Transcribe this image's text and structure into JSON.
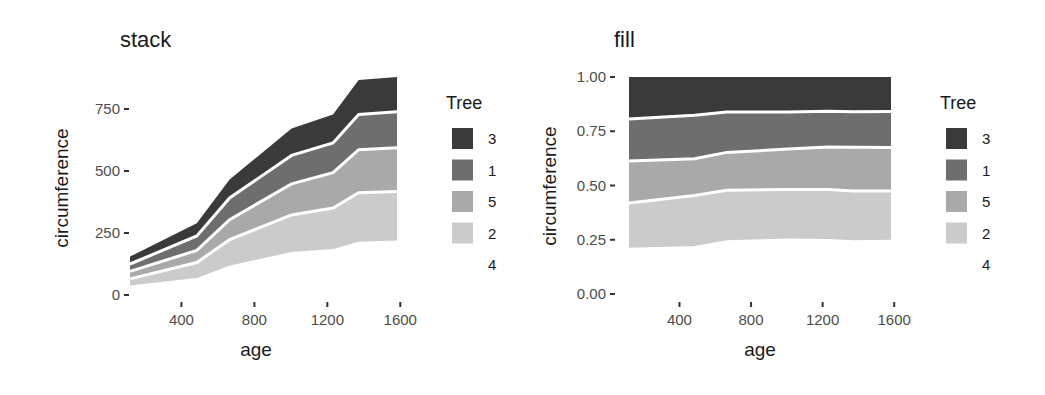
{
  "chart_data": [
    {
      "type": "area",
      "position": "stack",
      "title": "stack",
      "xlabel": "age",
      "ylabel": "circumference",
      "x": [
        118,
        484,
        664,
        1004,
        1231,
        1372,
        1582
      ],
      "stack_order_top_to_bottom": [
        "3",
        "1",
        "5",
        "2",
        "4"
      ],
      "series": [
        {
          "name": "3",
          "values": [
            30,
            51,
            75,
            108,
            115,
            139,
            140
          ]
        },
        {
          "name": "1",
          "values": [
            30,
            58,
            87,
            115,
            120,
            142,
            145
          ]
        },
        {
          "name": "5",
          "values": [
            30,
            49,
            81,
            125,
            142,
            174,
            177
          ]
        },
        {
          "name": "2",
          "values": [
            33,
            69,
            111,
            156,
            172,
            203,
            203
          ]
        },
        {
          "name": "4",
          "values": [
            32,
            62,
            112,
            167,
            179,
            209,
            214
          ]
        }
      ],
      "xticks": [
        400,
        800,
        1200,
        1600
      ],
      "yticks": [
        0,
        250,
        500,
        750
      ],
      "ytick_labels": [
        "0",
        "250",
        "500",
        "750"
      ],
      "xlim": [
        118,
        1582
      ],
      "ylim": [
        0,
        879
      ],
      "grid": false,
      "legend": {
        "title": "Tree",
        "position": "right",
        "entries": [
          "3",
          "1",
          "5",
          "2",
          "4"
        ]
      }
    },
    {
      "type": "area",
      "position": "fill",
      "title": "fill",
      "xlabel": "age",
      "ylabel": "circumference",
      "x": [
        118,
        484,
        664,
        1004,
        1231,
        1372,
        1582
      ],
      "stack_order_top_to_bottom": [
        "3",
        "1",
        "5",
        "2",
        "4"
      ],
      "series": [
        {
          "name": "3",
          "values": [
            30,
            51,
            75,
            108,
            115,
            139,
            140
          ]
        },
        {
          "name": "1",
          "values": [
            30,
            58,
            87,
            115,
            120,
            142,
            145
          ]
        },
        {
          "name": "5",
          "values": [
            30,
            49,
            81,
            125,
            142,
            174,
            177
          ]
        },
        {
          "name": "2",
          "values": [
            33,
            69,
            111,
            156,
            172,
            203,
            203
          ]
        },
        {
          "name": "4",
          "values": [
            32,
            62,
            112,
            167,
            179,
            209,
            214
          ]
        }
      ],
      "xticks": [
        400,
        800,
        1200,
        1600
      ],
      "yticks": [
        0,
        0.25,
        0.5,
        0.75,
        1.0
      ],
      "ytick_labels": [
        "0.00",
        "0.25",
        "0.50",
        "0.75",
        "1.00"
      ],
      "xlim": [
        118,
        1582
      ],
      "ylim": [
        0,
        1
      ],
      "grid": false,
      "legend": {
        "title": "Tree",
        "position": "right",
        "entries": [
          "3",
          "1",
          "5",
          "2",
          "4"
        ]
      }
    }
  ],
  "colors": {
    "3": "#3a3a3a",
    "1": "#6e6e6e",
    "5": "#a9a9a9",
    "2": "#cbcbcb",
    "4": "#ffffff",
    "separator": "#ffffff"
  }
}
